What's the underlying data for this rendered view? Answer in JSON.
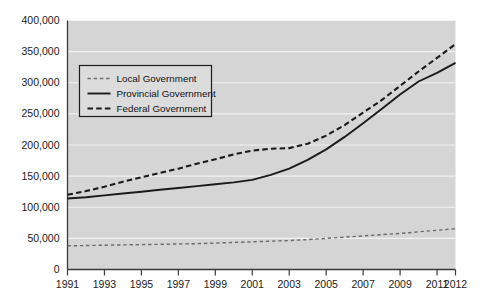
{
  "chart_data": {
    "type": "line",
    "title": "",
    "subtitle": "",
    "xlabel": "",
    "ylabel": "",
    "xlim": [
      1991,
      2012
    ],
    "ylim": [
      0,
      400000
    ],
    "grid": true,
    "legend_position": "upper-left-inside",
    "y_ticks": [
      0,
      50000,
      100000,
      150000,
      200000,
      250000,
      300000,
      350000,
      400000
    ],
    "y_tick_labels": [
      "0",
      "50,000",
      "100,000",
      "150,000",
      "200,000",
      "250,000",
      "300,000",
      "350,000",
      "400,000"
    ],
    "x_ticks": [
      1991,
      1993,
      1995,
      1997,
      1999,
      2001,
      2003,
      2005,
      2007,
      2009,
      2011,
      2012
    ],
    "x_tick_labels": [
      "1991",
      "1993",
      "1995",
      "1997",
      "1999",
      "2001",
      "2003",
      "2005",
      "2007",
      "2009",
      "2011",
      "2012"
    ],
    "x": [
      1991,
      1992,
      1993,
      1994,
      1995,
      1996,
      1997,
      1998,
      1999,
      2000,
      2001,
      2002,
      2003,
      2004,
      2005,
      2006,
      2007,
      2008,
      2009,
      2010,
      2011,
      2012
    ],
    "series": [
      {
        "name": "Local Government",
        "style": "dashed-light",
        "color": "#6b6b6b",
        "values": [
          38000,
          38500,
          39000,
          39500,
          40000,
          40500,
          41000,
          41500,
          42500,
          43500,
          44500,
          45500,
          46500,
          48000,
          50000,
          52000,
          54000,
          56000,
          58000,
          60500,
          63000,
          65500
        ]
      },
      {
        "name": "Provincial Government",
        "style": "solid",
        "color": "#1a1a1a",
        "values": [
          114000,
          116000,
          119000,
          122000,
          125000,
          128000,
          131000,
          134000,
          137000,
          140000,
          144000,
          152000,
          162000,
          176000,
          193000,
          213000,
          235000,
          258000,
          281000,
          302000,
          316000,
          332000
        ]
      },
      {
        "name": "Federal Government",
        "style": "dashed-bold",
        "color": "#1a1a1a",
        "values": [
          120000,
          126000,
          133000,
          141000,
          148000,
          155000,
          162000,
          170000,
          177000,
          185000,
          191000,
          194000,
          195000,
          202000,
          215000,
          232000,
          252000,
          272000,
          295000,
          318000,
          340000,
          362000
        ]
      }
    ],
    "legend_entries": [
      {
        "label": "Local Government",
        "style": "dashed-light",
        "color": "#6b6b6b"
      },
      {
        "label": "Provincial Government",
        "style": "solid",
        "color": "#1a1a1a"
      },
      {
        "label": "Federal Government",
        "style": "dashed-bold",
        "color": "#1a1a1a"
      }
    ],
    "colors": {
      "plot_background": "#d5d5d5",
      "page_background": "#ffffff",
      "gridline": "#f2f2f2",
      "axis": "#3a3a3a",
      "text": "#1a1a1a"
    }
  }
}
